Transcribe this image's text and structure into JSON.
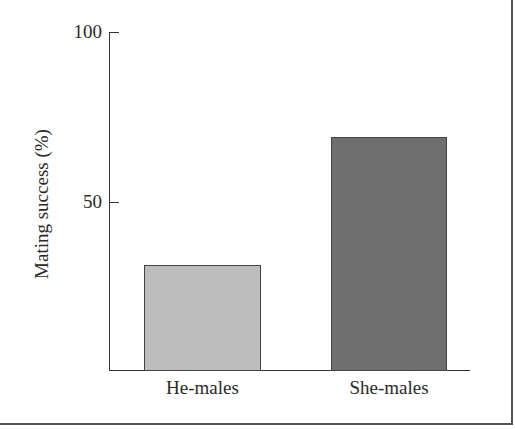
{
  "chart_data": {
    "type": "bar",
    "title": "",
    "xlabel": "",
    "ylabel": "Mating success (%)",
    "categories": [
      "He-males",
      "She-males"
    ],
    "values": [
      31,
      69
    ],
    "colors": [
      "#bdbdbd",
      "#6f6f6f"
    ],
    "ylim": [
      0,
      100
    ],
    "yticks": [
      50,
      100
    ],
    "grid": false,
    "legend": null
  },
  "axis": {
    "y_label": "Mating success (%)",
    "tick_100": "100",
    "tick_50": "50"
  },
  "bars": [
    {
      "label": "He-males",
      "value": 31
    },
    {
      "label": "She-males",
      "value": 69
    }
  ]
}
